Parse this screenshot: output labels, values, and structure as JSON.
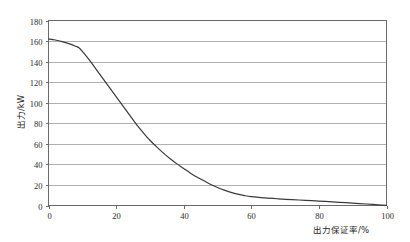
{
  "chart_data": {
    "type": "line",
    "title": "",
    "xlabel": "出力保证率/%",
    "ylabel": "出力/kW",
    "xlim": [
      0,
      100
    ],
    "ylim": [
      0,
      180
    ],
    "xticks": [
      0,
      20,
      40,
      60,
      80,
      100
    ],
    "yticks": [
      0,
      20,
      40,
      60,
      80,
      100,
      120,
      140,
      160,
      180
    ],
    "xtick_labels": [
      "0",
      "20",
      "40",
      "60",
      "80",
      "100"
    ],
    "ytick_labels": [
      "0",
      "20",
      "40",
      "60",
      "80",
      "100",
      "120",
      "140",
      "160",
      "180"
    ],
    "grid": "horizontal",
    "legend": "none",
    "series": [
      {
        "name": "出力",
        "color": "#3a3a3a",
        "x": [
          0,
          2,
          4,
          6,
          8,
          9,
          10,
          12,
          14,
          16,
          18,
          20,
          22,
          24,
          26,
          28,
          30,
          32,
          34,
          36,
          38,
          40,
          42,
          44,
          46,
          48,
          50,
          52,
          54,
          56,
          58,
          60,
          64,
          68,
          72,
          76,
          80,
          84,
          88,
          92,
          96,
          100
        ],
        "y": [
          162,
          161,
          159.5,
          157.5,
          155,
          153.5,
          150,
          142,
          133,
          124,
          115,
          106,
          97,
          88,
          79,
          71,
          63.5,
          57,
          51,
          45.5,
          40.5,
          36,
          31.5,
          27.5,
          24,
          20.5,
          17.5,
          15,
          12.8,
          11,
          9.6,
          8.6,
          7.4,
          6.5,
          5.7,
          5.0,
          4.3,
          3.5,
          2.7,
          1.9,
          1.0,
          0.2
        ]
      }
    ]
  },
  "axes": {
    "y_axis_title": "出力/kW",
    "x_axis_title": "出力保证率/%"
  },
  "colors": {
    "curve": "#3a3a3a",
    "gridline": "#b0b0b0",
    "frame": "#6a6a6a",
    "text": "#1f1f1f",
    "background": "#ffffff"
  }
}
